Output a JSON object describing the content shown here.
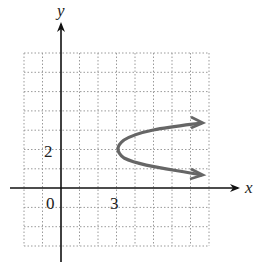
{
  "figure": {
    "type": "coordinate-graph",
    "axes": {
      "x_label": "x",
      "y_label": "y",
      "origin_label": "0",
      "x_tick_label": "3",
      "y_tick_label": "2",
      "grid": true,
      "x_range": [
        -2,
        8
      ],
      "y_range": [
        -3,
        7
      ]
    },
    "curve": {
      "description": "parabola opening right",
      "vertex": [
        3,
        2
      ],
      "arrow_ends": [
        [
          8,
          3.5
        ],
        [
          8,
          0.8
        ]
      ],
      "color": "#666666"
    },
    "colors": {
      "axis": "#111111",
      "grid": "#9a9a9a",
      "curve": "#666666"
    }
  }
}
